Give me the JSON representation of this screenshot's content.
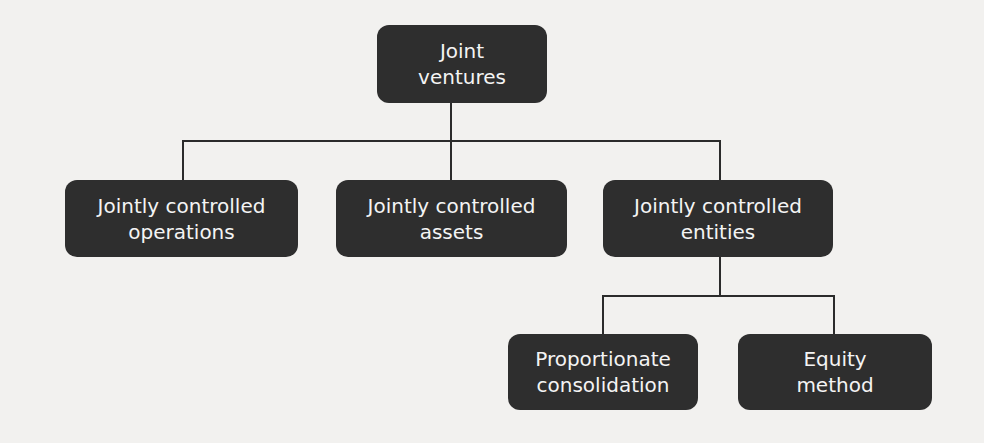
{
  "diagram": {
    "type": "org-tree",
    "root": {
      "id": "joint-ventures",
      "lines": [
        "Joint",
        "ventures"
      ]
    },
    "level1": [
      {
        "id": "jointly-controlled-operations",
        "lines": [
          "Jointly controlled",
          "operations"
        ]
      },
      {
        "id": "jointly-controlled-assets",
        "lines": [
          "Jointly controlled",
          "assets"
        ]
      },
      {
        "id": "jointly-controlled-entities",
        "lines": [
          "Jointly controlled",
          "entities"
        ]
      }
    ],
    "level2": [
      {
        "id": "proportionate-consolidation",
        "parent": "jointly-controlled-entities",
        "lines": [
          "Proportionate",
          "consolidation"
        ]
      },
      {
        "id": "equity-method",
        "parent": "jointly-controlled-entities",
        "lines": [
          "Equity",
          "method"
        ]
      }
    ],
    "colors": {
      "box_fill": "#2e2e2e",
      "box_text": "#f4f4f4",
      "connector": "#2b2b2b",
      "background": "#f2f1ef"
    }
  }
}
